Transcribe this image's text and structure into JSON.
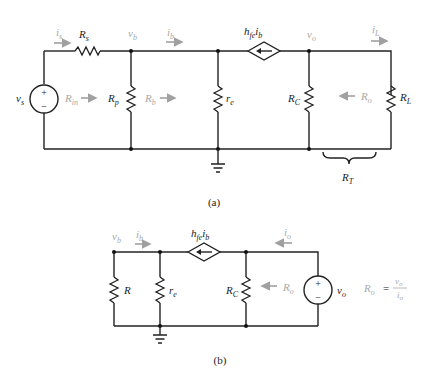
{
  "circuit_a": {
    "caption": "(a)",
    "labels": {
      "is": "i",
      "is_sub": "s",
      "Rs": "R",
      "Rs_sub": "s",
      "vb": "v",
      "vb_sub": "b",
      "ib": "i",
      "ib_sub": "b",
      "dep_source": "h",
      "dep_source_sub": "fe",
      "dep_source_i": "i",
      "dep_source_i_sub": "b",
      "vo": "v",
      "vo_sub": "o",
      "iL": "i",
      "iL_sub": "L",
      "vs": "v",
      "vs_sub": "s",
      "Rin": "R",
      "Rin_sub": "in",
      "Rp": "R",
      "Rp_sub": "p",
      "Rb": "R",
      "Rb_sub": "b",
      "re": "r",
      "re_sub": "e",
      "RC": "R",
      "RC_sub": "C",
      "Ro": "R",
      "Ro_sub": "o",
      "RL": "R",
      "RL_sub": "L",
      "RT": "R",
      "RT_sub": "T",
      "plus": "+",
      "minus": "−"
    }
  },
  "circuit_b": {
    "caption": "(b)",
    "labels": {
      "vb": "v",
      "vb_sub": "b",
      "ib": "i",
      "ib_sub": "b",
      "dep_source": "h",
      "dep_source_sub": "fe",
      "dep_source_i": "i",
      "dep_source_i_sub": "b",
      "io": "i",
      "io_sub": "o",
      "R": "R",
      "re": "r",
      "re_sub": "e",
      "RC": "R",
      "RC_sub": "C",
      "Ro": "R",
      "Ro_sub": "o",
      "vo": "v",
      "vo_sub": "o",
      "plus": "+",
      "minus": "−",
      "formula_lhs": "R",
      "formula_lhs_sub": "o",
      "formula_eq": "=",
      "formula_num": "v",
      "formula_num_sub": "o",
      "formula_den": "i",
      "formula_den_sub": "o"
    }
  },
  "colors": {
    "wire": "#222222",
    "annotation_gray": "#a8a8a8"
  }
}
